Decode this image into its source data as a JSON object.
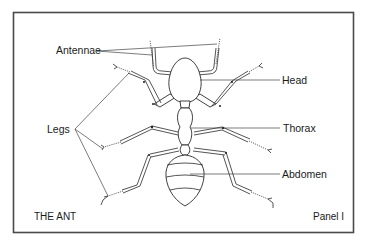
{
  "diagram": {
    "title": "THE ANT",
    "panel": "Panel I",
    "labels": {
      "antennae": "Antennae",
      "head": "Head",
      "thorax": "Thorax",
      "abdomen": "Abdomen",
      "legs": "Legs"
    },
    "colors": {
      "background": "#ffffff",
      "frame": "#4a4a4a",
      "ink": "#2a2a2a"
    }
  }
}
